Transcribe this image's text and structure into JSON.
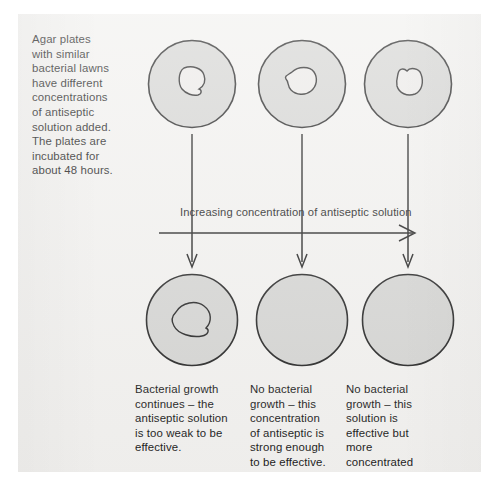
{
  "figure": {
    "background_color": "#f2f1ef",
    "ink_color": "#1c1c1c",
    "dish_fill_color": "#d5d5d3",
    "dish_stroke_color": "#262626"
  },
  "intro": {
    "text": "Agar plates\nwith similar\nbacterial lawns\nhave different\nconcentrations\nof antiseptic\nsolution added.\nThe plates are\nincubated for\nabout 48 hours."
  },
  "gradient_arrow": {
    "label": "Increasing concentration of antiseptic solution"
  },
  "top_row": {
    "label": "Agar plates before incubation with antiseptic discs",
    "dishes": [
      {
        "id": "top-dish-1",
        "has_clear_zone": true,
        "clear_zone_size": "small"
      },
      {
        "id": "top-dish-2",
        "has_clear_zone": true,
        "clear_zone_size": "small"
      },
      {
        "id": "top-dish-3",
        "has_clear_zone": true,
        "clear_zone_size": "small"
      }
    ]
  },
  "bottom_row": {
    "label": "Agar plates after 48 hours of incubation",
    "dishes": [
      {
        "id": "bottom-dish-1",
        "has_clear_zone": true,
        "clear_zone_size": "large"
      },
      {
        "id": "bottom-dish-2",
        "has_clear_zone": false,
        "clear_zone_size": "none"
      },
      {
        "id": "bottom-dish-3",
        "has_clear_zone": false,
        "clear_zone_size": "none"
      }
    ]
  },
  "captions": [
    {
      "id": "caption-1",
      "text": "Bacterial growth\ncontinues – the\nantiseptic solution\nis too weak to be\neffective."
    },
    {
      "id": "caption-2",
      "text": "No bacterial\ngrowth – this\nconcentration\nof antiseptic is\nstrong enough\nto be effective."
    },
    {
      "id": "caption-3",
      "text": "No bacterial\ngrowth – this\nsolution is\neffective but\nmore\nconcentrated\nthan necessary."
    }
  ]
}
